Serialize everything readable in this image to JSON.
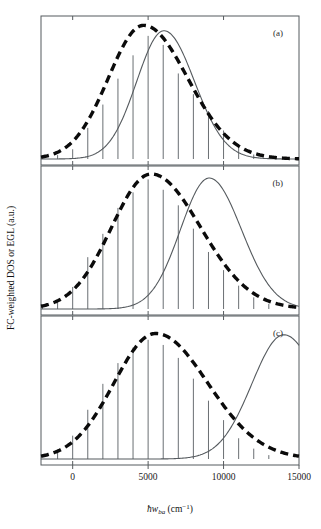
{
  "figure": {
    "xlabel_prefix": "ħw",
    "xlabel_sub": "ba",
    "xlabel_units_open": " (cm",
    "xlabel_units_sup": "−1",
    "xlabel_units_close": ")",
    "xlabel_full": "ħw_ba (cm−1)",
    "ylabel": "FC-weighted DOS or EGL (a.u.)",
    "panel_labels": [
      "(a)",
      "(b)",
      "(c)"
    ],
    "colors": {
      "stick": "#6a6f73",
      "egl_curve": "#555a5e",
      "dos_envelope": "#0b0b0b",
      "frame": "#555a5e",
      "background": "#ffffff"
    }
  },
  "chart_data": {
    "type": "line",
    "title": "",
    "xlabel": "ħw_ba (cm−1)",
    "ylabel": "FC-weighted DOS or EGL (a.u.)",
    "xlim": [
      -2100,
      15000
    ],
    "ylim": [
      0,
      1.05
    ],
    "grid": false,
    "legend": null,
    "xticks": [
      0,
      5000,
      10000,
      15000
    ],
    "xticklabels": [
      "0",
      "5000",
      "10000",
      "15000"
    ],
    "panels": [
      {
        "label": "(a)",
        "series": [
          {
            "name": "FC-weighted DOS sticks",
            "type": "stem",
            "x": [
              -2000,
              -1000,
              0,
              1000,
              2000,
              3000,
              4000,
              5000,
              6000,
              7000,
              8000,
              9000,
              10000,
              11000,
              12000
            ],
            "values": [
              0.012,
              0.03,
              0.075,
              0.24,
              0.42,
              0.62,
              0.8,
              0.95,
              0.88,
              0.66,
              0.5,
              0.37,
              0.22,
              0.1,
              0.035
            ]
          },
          {
            "name": "FC-weighted DOS envelope",
            "type": "line",
            "style": "dashed-thick",
            "peak_x": 4700,
            "width": 3300,
            "peak_y": 0.99
          },
          {
            "name": "EGL",
            "type": "line",
            "style": "solid-thin",
            "peak_x": 6050,
            "width": 2550,
            "peak_y": 0.95
          }
        ]
      },
      {
        "label": "(b)",
        "series": [
          {
            "name": "FC-weighted DOS sticks",
            "type": "stem",
            "x": [
              -2000,
              -1000,
              0,
              1000,
              2000,
              3000,
              4000,
              5000,
              6000,
              7000,
              8000,
              9000,
              10000,
              11000,
              12000,
              13000
            ],
            "values": [
              0.02,
              0.06,
              0.17,
              0.4,
              0.58,
              0.78,
              0.9,
              1.0,
              0.92,
              0.8,
              0.62,
              0.44,
              0.3,
              0.18,
              0.09,
              0.04
            ]
          },
          {
            "name": "FC-weighted DOS envelope",
            "type": "line",
            "style": "dashed-thick",
            "peak_x": 5200,
            "width": 3700,
            "peak_y": 1.0
          },
          {
            "name": "EGL",
            "type": "line",
            "style": "solid-thin",
            "peak_x": 9050,
            "width": 2700,
            "peak_y": 0.97
          }
        ]
      },
      {
        "label": "(c)",
        "series": [
          {
            "name": "FC-weighted DOS sticks",
            "type": "stem",
            "x": [
              -1000,
              0,
              1000,
              2000,
              3000,
              4000,
              5000,
              6000,
              7000,
              8000,
              9000,
              10000,
              11000,
              12000,
              13000
            ],
            "values": [
              0.05,
              0.18,
              0.38,
              0.58,
              0.74,
              0.86,
              0.92,
              0.88,
              0.78,
              0.62,
              0.45,
              0.3,
              0.16,
              0.08,
              0.03
            ]
          },
          {
            "name": "FC-weighted DOS envelope",
            "type": "line",
            "style": "dashed-thick",
            "peak_x": 5500,
            "width": 3900,
            "peak_y": 0.93
          },
          {
            "name": "EGL",
            "type": "line",
            "style": "solid-thin",
            "peak_x": 14000,
            "width": 3000,
            "peak_y": 0.92
          }
        ]
      }
    ]
  }
}
